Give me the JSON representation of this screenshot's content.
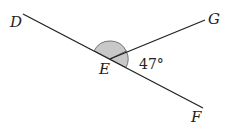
{
  "diagram": {
    "type": "geometry-angles",
    "points": {
      "D": {
        "label": "D",
        "x": 23,
        "y": 14
      },
      "E": {
        "label": "E",
        "x": 110,
        "y": 59
      },
      "F": {
        "label": "F",
        "x": 203,
        "y": 108
      },
      "G": {
        "label": "G",
        "x": 205,
        "y": 20
      }
    },
    "segments": [
      "DF",
      "EG"
    ],
    "angles": [
      {
        "name": "angle-DEG",
        "shaded": true,
        "label": ""
      },
      {
        "name": "angle-GEF",
        "shaded": true,
        "label": "47°"
      }
    ],
    "shade_color": "#c8c8c8",
    "line_color": "#222222"
  }
}
